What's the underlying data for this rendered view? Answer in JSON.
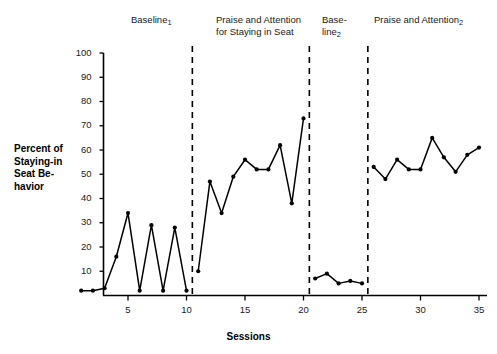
{
  "chart_data": {
    "type": "line",
    "title": "",
    "xlabel": "Sessions",
    "ylabel": "Percent of\nStaying-in\nSeat Be-\nhavior",
    "xlim": [
      0,
      36
    ],
    "ylim": [
      0,
      100
    ],
    "grid": false,
    "legend": "none",
    "xticks": [
      5,
      10,
      15,
      20,
      25,
      30,
      35
    ],
    "yticks": [
      10,
      20,
      30,
      40,
      50,
      60,
      70,
      80,
      90,
      100
    ],
    "marker": "filled-circle",
    "line_color": "#000000",
    "series": [
      {
        "name": "Percent of Staying-in Seat Behavior",
        "x": [
          1,
          2,
          3,
          4,
          5,
          6,
          7,
          8,
          9,
          10,
          11,
          12,
          13,
          14,
          15,
          16,
          17,
          18,
          19,
          20,
          21,
          22,
          23,
          24,
          25,
          26,
          27,
          28,
          29,
          30,
          31,
          32,
          33,
          34,
          35
        ],
        "values": [
          2,
          2,
          3,
          16,
          34,
          2,
          29,
          2,
          28,
          2,
          10,
          47,
          34,
          49,
          56,
          52,
          52,
          62,
          38,
          73,
          7,
          9,
          5,
          6,
          5,
          53,
          48,
          56,
          52,
          52,
          65,
          57,
          51,
          58,
          61
        ]
      }
    ],
    "phases": [
      {
        "label": "Baseline",
        "subscript": "1",
        "start": 1,
        "end": 10
      },
      {
        "label": "Praise and Attention\nfor Staying in Seat",
        "subscript": "",
        "start": 11,
        "end": 20
      },
      {
        "label": "Base-\nline",
        "subscript": "2",
        "start": 21,
        "end": 25
      },
      {
        "label": "Praise and Attention",
        "subscript": "2",
        "start": 26,
        "end": 35
      }
    ],
    "phase_lines": [
      10.5,
      20.5,
      25.5
    ],
    "phase_line_style": "dashed"
  },
  "axes": {
    "y_title": "Percent of\nStaying-in\nSeat Be-\nhavior",
    "x_title": "Sessions"
  }
}
